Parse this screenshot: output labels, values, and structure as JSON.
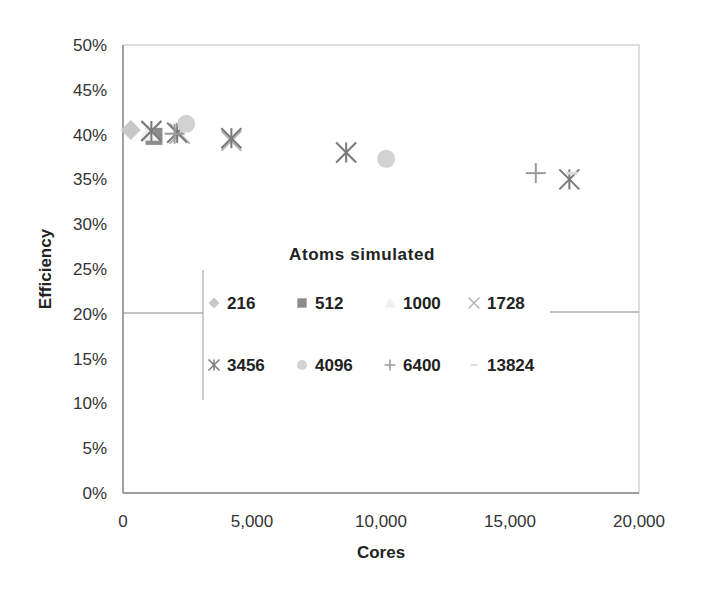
{
  "chart_data": {
    "type": "scatter",
    "title": "",
    "xlabel": "Cores",
    "ylabel": "Efficiency",
    "xlim": [
      0,
      20000
    ],
    "ylim": [
      0,
      0.5
    ],
    "x_ticks": [
      "0",
      "5,000",
      "10,000",
      "15,000",
      "20,000"
    ],
    "y_ticks": [
      "0%",
      "5%",
      "10%",
      "15%",
      "20%",
      "25%",
      "30%",
      "35%",
      "40%",
      "45%",
      "50%"
    ],
    "grid": false,
    "legend": {
      "title": "Atoms simulated",
      "position": "inside-center",
      "entries": [
        "216",
        "512",
        "1000",
        "1728",
        "3456",
        "4096",
        "6400",
        "13824"
      ]
    },
    "series": [
      {
        "name": "216",
        "marker": "diamond",
        "color": "#c8c8c8",
        "points": [
          [
            300,
            0.405
          ]
        ]
      },
      {
        "name": "512",
        "marker": "square",
        "color": "#8c8c8c",
        "points": [
          [
            1200,
            0.398
          ]
        ]
      },
      {
        "name": "1000",
        "marker": "triangle",
        "color": "#f0f0f0",
        "points": [
          [
            1000,
            0.402
          ]
        ]
      },
      {
        "name": "1728",
        "marker": "x",
        "color": "#b4b4b4",
        "points": [
          [
            1100,
            0.404
          ],
          [
            2200,
            0.401
          ],
          [
            4200,
            0.393
          ]
        ]
      },
      {
        "name": "3456",
        "marker": "asterisk",
        "color": "#7a7a7a",
        "points": [
          [
            1100,
            0.404
          ],
          [
            2100,
            0.402
          ],
          [
            4200,
            0.396
          ],
          [
            8650,
            0.38
          ],
          [
            17300,
            0.35
          ]
        ]
      },
      {
        "name": "4096",
        "marker": "circle",
        "color": "#d2d2d2",
        "points": [
          [
            2450,
            0.412
          ],
          [
            10200,
            0.373
          ]
        ]
      },
      {
        "name": "6400",
        "marker": "plus",
        "color": "#9a9a9a",
        "points": [
          [
            2000,
            0.401
          ],
          [
            16000,
            0.357
          ]
        ]
      },
      {
        "name": "13824",
        "marker": "dash",
        "color": "#dcdcdc",
        "points": [
          [
            17400,
            0.357
          ]
        ]
      }
    ]
  }
}
